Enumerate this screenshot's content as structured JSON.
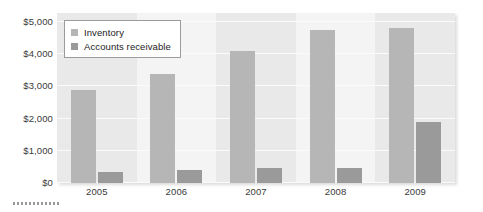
{
  "chart_data": {
    "type": "bar",
    "title": "",
    "subtitle": "",
    "xlabel": "",
    "ylabel": "",
    "categories": [
      "2005",
      "2006",
      "2007",
      "2008",
      "2009"
    ],
    "series": [
      {
        "name": "Inventory",
        "color": "#b6b6b6",
        "values": [
          2900,
          3400,
          4100,
          4750,
          4800
        ]
      },
      {
        "name": "Accounts receivable",
        "color": "#9a9a9a",
        "values": [
          350,
          400,
          470,
          470,
          1900
        ]
      }
    ],
    "ylim": [
      0,
      5000
    ],
    "ytick_values": [
      5000,
      4000,
      3000,
      2000,
      1000,
      0
    ],
    "ytick_labels": [
      "$5,000",
      "$4,000",
      "$3,000",
      "$2,000",
      "$1,000",
      "$0"
    ],
    "grid": true,
    "grid_axis": "y",
    "legend_position": "upper left",
    "plot_background": "#f2f2f2",
    "band_color": "#e9e9e9"
  },
  "legend": {
    "entries": [
      {
        "label": "Inventory",
        "swatch": "series-inventory"
      },
      {
        "label": "Accounts receivable",
        "swatch": "series-ar"
      }
    ]
  }
}
